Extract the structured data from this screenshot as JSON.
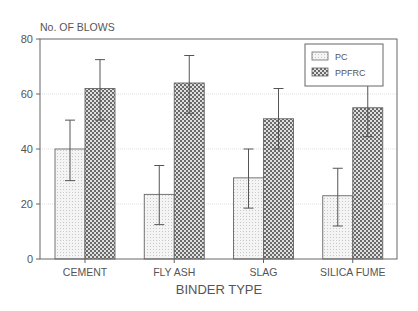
{
  "chart_data": {
    "type": "bar",
    "title": "",
    "ylabel": "No. OF BLOWS",
    "xlabel": "BINDER TYPE",
    "ylim": [
      0,
      80
    ],
    "yticks": [
      0,
      20,
      40,
      60,
      80
    ],
    "grid": true,
    "legend_position": "upper right",
    "categories": [
      "CEMENT",
      "FLY ASH",
      "SLAG",
      "SILICA FUME"
    ],
    "series": [
      {
        "name": "PC",
        "pattern": "fine-dots",
        "values": [
          40,
          23.5,
          29.5,
          23
        ],
        "error_low": [
          28.5,
          12.5,
          18.5,
          12
        ],
        "error_high": [
          50.5,
          34,
          40,
          33
        ]
      },
      {
        "name": "PPFRC",
        "pattern": "checker",
        "values": [
          62,
          64,
          51,
          55
        ],
        "error_low": [
          50.5,
          53,
          40,
          44.5
        ],
        "error_high": [
          72.5,
          74,
          62,
          65.5
        ]
      }
    ]
  },
  "colors": {
    "axis": "#555555",
    "grid": "#d8d8d8",
    "pc_fill": "#eeeeee",
    "ppfrc_fill": "#777777"
  }
}
